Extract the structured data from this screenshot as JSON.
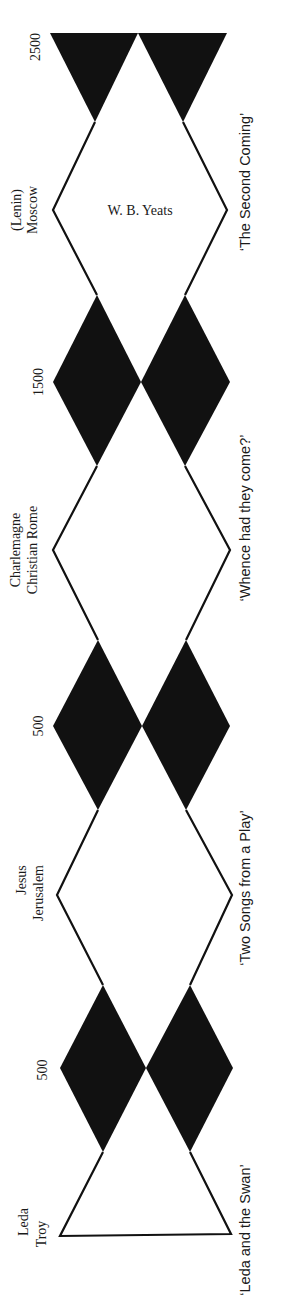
{
  "diagram": {
    "colors": {
      "ink": "#111111",
      "paper": "#ffffff"
    },
    "center_label": "W. B. Yeats",
    "left_labels": [
      {
        "id": "l2500",
        "lines": [
          "2500"
        ],
        "y": 47
      },
      {
        "id": "moscow",
        "lines": [
          "(Lenin)",
          "Moscow"
        ],
        "y": 210
      },
      {
        "id": "l1500",
        "lines": [
          "1500"
        ],
        "y": 382
      },
      {
        "id": "rome",
        "lines": [
          "Charlemagne",
          "Christian Rome"
        ],
        "y": 550
      },
      {
        "id": "l500ad",
        "lines": [
          "500"
        ],
        "y": 726
      },
      {
        "id": "jerusalem",
        "lines": [
          "Jesus",
          "Jerusalem"
        ],
        "y": 895
      },
      {
        "id": "l500bc",
        "lines": [
          "500"
        ],
        "y": 1068
      },
      {
        "id": "troy",
        "lines": [
          "Leda",
          "Troy"
        ],
        "y": 1222
      }
    ],
    "right_labels": [
      {
        "id": "second-coming",
        "text": "‘The Second Coming’",
        "y": 185
      },
      {
        "id": "whence",
        "text": "‘Whence had they come?’",
        "y": 520
      },
      {
        "id": "two-songs",
        "text": "‘Two Songs from a Play’",
        "y": 880
      },
      {
        "id": "leda-swan",
        "text": "‘Leda and the Swan’",
        "y": 1225
      }
    ]
  }
}
